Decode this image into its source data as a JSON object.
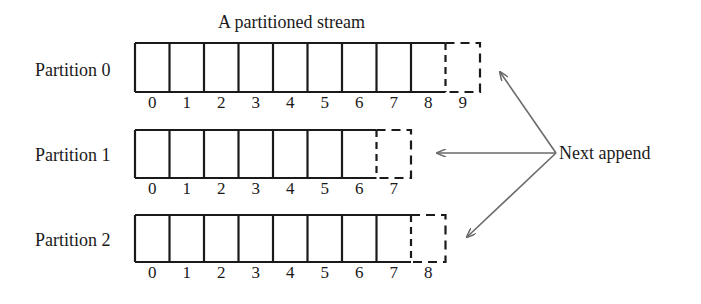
{
  "title": "A partitioned stream",
  "next_append_label": "Next append",
  "colors": {
    "stroke": "#1a1a1a",
    "arrow": "#6a6a6a",
    "background": "#ffffff"
  },
  "partitions": [
    {
      "label": "Partition 0",
      "filled_offsets": [
        0,
        1,
        2,
        3,
        4,
        5,
        6,
        7,
        8
      ],
      "next_offset": 9,
      "offset_labels": [
        "0",
        "1",
        "2",
        "3",
        "4",
        "5",
        "6",
        "7",
        "8",
        "9"
      ]
    },
    {
      "label": "Partition 1",
      "filled_offsets": [
        0,
        1,
        2,
        3,
        4,
        5,
        6
      ],
      "next_offset": 7,
      "offset_labels": [
        "0",
        "1",
        "2",
        "3",
        "4",
        "5",
        "6",
        "7"
      ]
    },
    {
      "label": "Partition 2",
      "filled_offsets": [
        0,
        1,
        2,
        3,
        4,
        5,
        6,
        7
      ],
      "next_offset": 8,
      "offset_labels": [
        "0",
        "1",
        "2",
        "3",
        "4",
        "5",
        "6",
        "7",
        "8"
      ]
    }
  ]
}
